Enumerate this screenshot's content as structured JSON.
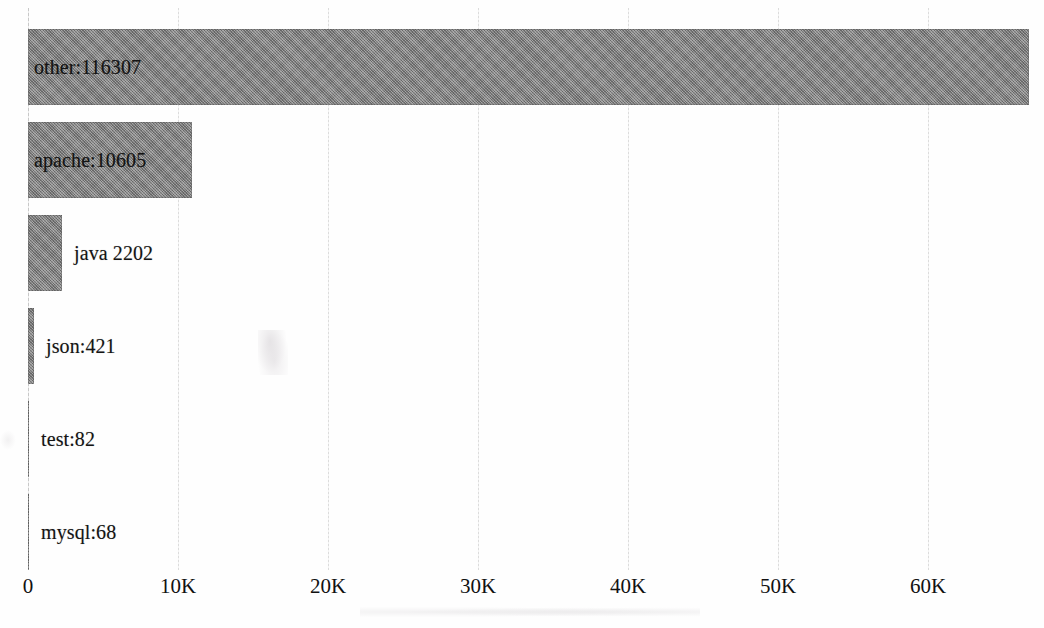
{
  "chart_data": {
    "type": "bar",
    "orientation": "horizontal",
    "title": "",
    "subtitle": "",
    "xlabel": "",
    "ylabel": "",
    "grid": true,
    "legend": false,
    "xlim": [
      0,
      66700
    ],
    "xticks": [
      0,
      10000,
      20000,
      30000,
      40000,
      50000,
      60000
    ],
    "xtick_labels": [
      "0",
      "10K",
      "20K",
      "30K",
      "40K",
      "50K",
      "60K"
    ],
    "categories": [
      "other",
      "apache",
      "java",
      "json",
      "test",
      "mysql"
    ],
    "values": [
      116307,
      10605,
      2202,
      421,
      82,
      68
    ],
    "bar_extent_values": [
      66700,
      10933,
      2267,
      400,
      67,
      67
    ],
    "data_labels": [
      "other:116307",
      "apache:10605",
      "java 2202",
      "json:421",
      "test:82",
      "mysql:68"
    ],
    "colors": {
      "bar_fill": "#848484",
      "gridline": "#e2e2e2",
      "text": "#141414",
      "background": "#fefefe"
    },
    "note": "Bar lengths are clipped to the plot width; the 'other' bar is labelled 116307 but drawn to about 66.7K."
  },
  "axis": {
    "ticks": [
      {
        "label": "0",
        "value": 0
      },
      {
        "label": "10K",
        "value": 10000
      },
      {
        "label": "20K",
        "value": 20000
      },
      {
        "label": "30K",
        "value": 30000
      },
      {
        "label": "40K",
        "value": 40000
      },
      {
        "label": "50K",
        "value": 50000
      },
      {
        "label": "60K",
        "value": 60000
      }
    ]
  },
  "bars": [
    {
      "name": "other",
      "label": "other:116307",
      "value": 116307,
      "drawn_value": 66700
    },
    {
      "name": "apache",
      "label": "apache:10605",
      "value": 10605,
      "drawn_value": 10933
    },
    {
      "name": "java",
      "label": "java 2202",
      "value": 2202,
      "drawn_value": 2267
    },
    {
      "name": "json",
      "label": "json:421",
      "value": 421,
      "drawn_value": 400
    },
    {
      "name": "test",
      "label": "test:82",
      "value": 82,
      "drawn_value": 67
    },
    {
      "name": "mysql",
      "label": "mysql:68",
      "value": 68,
      "drawn_value": 67
    }
  ]
}
